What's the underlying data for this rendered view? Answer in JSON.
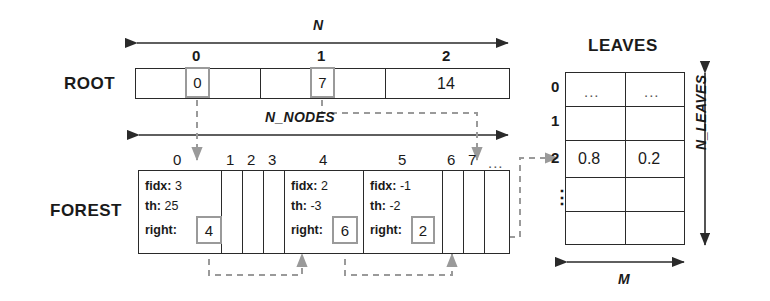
{
  "diagram": {
    "title_leaves": "LEAVES",
    "label_root": "ROOT",
    "label_forest": "FOREST",
    "dim_n": "N",
    "dim_n_nodes": "N_NODES",
    "dim_n_leaves": "N_LEAVES",
    "dim_m": "M"
  },
  "root": {
    "indices": [
      "0",
      "1",
      "2"
    ],
    "values": [
      "0",
      "7",
      "14"
    ],
    "highlighted": [
      true,
      true,
      false
    ]
  },
  "forest": {
    "indices": [
      "0",
      "1",
      "2",
      "3",
      "4",
      "5",
      "6",
      "7",
      "..."
    ],
    "nodes": [
      {
        "index": "0",
        "fidx_label": "fidx:",
        "fidx": "3",
        "th_label": "th:",
        "th": "25",
        "right_label": "right:",
        "right": "4"
      },
      {
        "index": "4",
        "fidx_label": "fidx:",
        "fidx": "2",
        "th_label": "th:",
        "th": "-3",
        "right_label": "right:",
        "right": "6"
      },
      {
        "index": "5",
        "fidx_label": "fidx:",
        "fidx": "-1",
        "th_label": "th:",
        "th": "-2",
        "right_label": "right:",
        "right": "2"
      }
    ]
  },
  "leaves": {
    "row_labels": [
      "0",
      "1",
      "2",
      "⋮",
      ""
    ],
    "rows": [
      [
        "...",
        "..."
      ],
      [
        "",
        ""
      ],
      [
        "0.8",
        "0.2"
      ],
      [
        "",
        ""
      ],
      [
        "",
        ""
      ]
    ]
  },
  "colors": {
    "stroke": "#2a2a2a",
    "highlight_stroke": "#9a9a9a",
    "dashed": "#9a9a9a",
    "background": "#ffffff"
  }
}
